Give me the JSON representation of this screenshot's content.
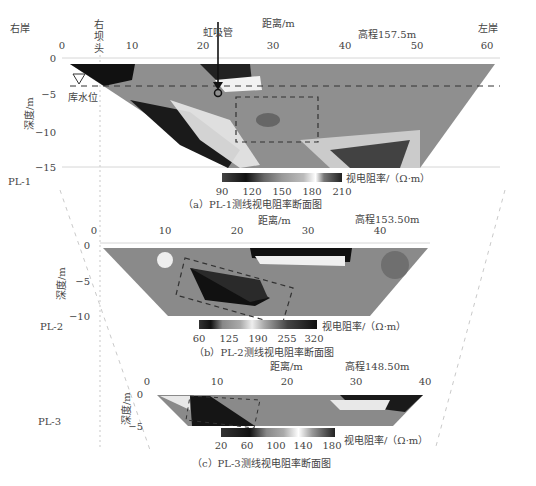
{
  "figure": {
    "labels": {
      "right_bank": "右岸",
      "left_bank": "左岸",
      "right_dam_head": [
        "右",
        "坝",
        "头"
      ],
      "siphon": "虹吸管",
      "reservoir_level": "库水位",
      "depth_axis": "深度/m",
      "distance_axis": "距离/m",
      "resistivity_unit": "视电阻率/（Ω·m）"
    },
    "panels": [
      {
        "id": "PL-1",
        "line_label": "PL-1",
        "elevation": "高程157.5m",
        "caption": "（a）PL-1测线视电阻率断面图",
        "x_ticks": [
          "0",
          "10",
          "20",
          "30",
          "40",
          "50",
          "60"
        ],
        "y_ticks": [
          "0",
          "−5",
          "−10",
          "−15"
        ],
        "colorbar_ticks": [
          "90",
          "120",
          "150",
          "180",
          "210"
        ]
      },
      {
        "id": "PL-2",
        "line_label": "PL-2",
        "elevation": "高程153.50m",
        "caption": "（b）PL-2测线视电阻率断面图",
        "x_ticks": [
          "0",
          "10",
          "20",
          "30",
          "40"
        ],
        "y_ticks": [
          "0",
          "−5",
          "−10"
        ],
        "colorbar_ticks": [
          "60",
          "125",
          "190",
          "255",
          "320"
        ]
      },
      {
        "id": "PL-3",
        "line_label": "PL-3",
        "elevation": "高程148.50m",
        "caption": "（c）PL-3测线视电阻率断面图",
        "x_ticks": [
          "0",
          "10",
          "20",
          "30",
          "40"
        ],
        "y_ticks": [
          "0",
          "−5"
        ],
        "colorbar_ticks": [
          "20",
          "60",
          "100",
          "140",
          "180"
        ]
      }
    ]
  }
}
